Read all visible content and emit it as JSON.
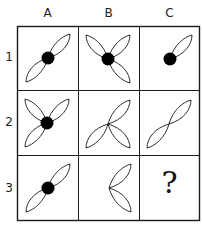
{
  "puzzle": {
    "columns": [
      "A",
      "B",
      "C"
    ],
    "rows": [
      "1",
      "2",
      "3"
    ],
    "cells": [
      {
        "row": 1,
        "col": "A",
        "petals": [
          "NE",
          "SW"
        ],
        "dot": true
      },
      {
        "row": 1,
        "col": "B",
        "petals": [
          "NE",
          "NW",
          "SE"
        ],
        "dot": true
      },
      {
        "row": 1,
        "col": "C",
        "petals": [
          "NE"
        ],
        "dot": true
      },
      {
        "row": 2,
        "col": "A",
        "petals": [
          "NE",
          "NW",
          "SW"
        ],
        "dot": true
      },
      {
        "row": 2,
        "col": "B",
        "petals": [
          "NE",
          "SW",
          "SE"
        ],
        "dot": false
      },
      {
        "row": 2,
        "col": "C",
        "petals": [
          "NE",
          "SW"
        ],
        "dot": false
      },
      {
        "row": 3,
        "col": "A",
        "petals": [
          "NE",
          "SW"
        ],
        "dot": true
      },
      {
        "row": 3,
        "col": "B",
        "petals": [
          "NE",
          "SE"
        ],
        "dot": false
      },
      {
        "row": 3,
        "col": "C",
        "missing": true,
        "symbol": "?"
      }
    ],
    "colors": {
      "line": "#1a1a1a",
      "dot": "#000000",
      "background": "#ffffff"
    }
  }
}
